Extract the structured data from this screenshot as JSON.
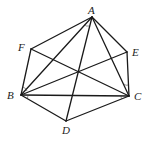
{
  "diagram": {
    "type": "geometry",
    "points": [
      {
        "name": "A",
        "x": 92,
        "y": 17,
        "label_x": 88,
        "label_y": 14
      },
      {
        "name": "B",
        "x": 21,
        "y": 95,
        "label_x": 7,
        "label_y": 99
      },
      {
        "name": "C",
        "x": 129,
        "y": 96,
        "label_x": 134,
        "label_y": 100
      },
      {
        "name": "D",
        "x": 66,
        "y": 121,
        "label_x": 62,
        "label_y": 134
      },
      {
        "name": "E",
        "x": 127,
        "y": 52,
        "label_x": 132,
        "label_y": 56
      },
      {
        "name": "F",
        "x": 31,
        "y": 49,
        "label_x": 18,
        "label_y": 51
      }
    ],
    "labels": {
      "A": "A",
      "B": "B",
      "C": "C",
      "D": "D",
      "E": "E",
      "F": "F"
    },
    "segments": [
      [
        "A",
        "F"
      ],
      [
        "F",
        "B"
      ],
      [
        "B",
        "D"
      ],
      [
        "D",
        "C"
      ],
      [
        "C",
        "E"
      ],
      [
        "E",
        "A"
      ],
      [
        "A",
        "B"
      ],
      [
        "A",
        "C"
      ],
      [
        "A",
        "D"
      ],
      [
        "B",
        "C"
      ],
      [
        "B",
        "E"
      ],
      [
        "F",
        "C"
      ]
    ]
  }
}
